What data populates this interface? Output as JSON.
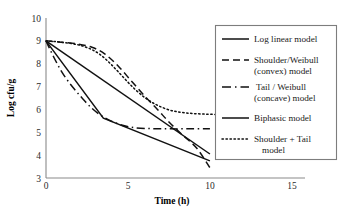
{
  "chart_data": {
    "type": "line",
    "title": "",
    "xlabel": "Time (h)",
    "ylabel": "Log cfu/g",
    "xlim": [
      0,
      15.8
    ],
    "ylim": [
      3,
      10
    ],
    "xticks": [
      "0",
      "5",
      "10",
      "15"
    ],
    "xtick_values": [
      0,
      5,
      10,
      15
    ],
    "yticks": [
      "3",
      "4",
      "5",
      "6",
      "7",
      "8",
      "9",
      "10"
    ],
    "ytick_values": [
      3,
      4,
      5,
      6,
      7,
      8,
      9,
      10
    ],
    "grid": false,
    "legend_position": "upper right",
    "series": [
      {
        "name": "Log linear  model",
        "style": "solid",
        "x": [
          0,
          10
        ],
        "y": [
          9.0,
          4.05
        ]
      },
      {
        "name": "Shoulder/Weibull (convex) model",
        "style": "dashed",
        "x": [
          0,
          0.8,
          1.8,
          2.8,
          3.6,
          4.4,
          5.2,
          6.0,
          6.8,
          7.5,
          8.3,
          9.2,
          10.0
        ],
        "y": [
          9.0,
          8.95,
          8.88,
          8.72,
          8.42,
          7.9,
          7.25,
          6.6,
          6.0,
          5.45,
          4.9,
          4.3,
          3.45
        ]
      },
      {
        "name": "Tail / Weibull (concave) model",
        "style": "dashdot",
        "x": [
          0,
          0.5,
          1.0,
          1.6,
          2.2,
          2.8,
          3.4,
          4.2,
          5.2,
          6.4,
          7.6,
          8.8,
          10.0
        ],
        "y": [
          9.0,
          8.25,
          7.6,
          7.0,
          6.5,
          6.05,
          5.72,
          5.42,
          5.22,
          5.16,
          5.15,
          5.15,
          5.15
        ]
      },
      {
        "name": "Biphasic model",
        "style": "solid",
        "x": [
          0,
          3.5,
          10.0
        ],
        "y": [
          9.0,
          5.62,
          3.75
        ]
      },
      {
        "name": "Shoulder + Tail model",
        "style": "dotted",
        "x": [
          0,
          0.8,
          1.8,
          2.6,
          3.3,
          4.0,
          4.7,
          5.4,
          6.1,
          6.8,
          7.6,
          8.5,
          9.5,
          10.6,
          11.6
        ],
        "y": [
          9.0,
          8.95,
          8.85,
          8.68,
          8.4,
          7.95,
          7.42,
          6.9,
          6.48,
          6.18,
          5.96,
          5.85,
          5.8,
          5.78,
          5.78
        ]
      }
    ]
  },
  "legend": {
    "entries": [
      {
        "label_line1": "Log linear  model",
        "label_line2": ""
      },
      {
        "label_line1": "Shoulder/Weibull",
        "label_line2": "(convex) model"
      },
      {
        "label_line1": "Tail / Weibull",
        "label_line2": "(concave) model"
      },
      {
        "label_line1": "Biphasic model",
        "label_line2": ""
      },
      {
        "label_line1": "Shoulder + Tail",
        "label_line2": "model"
      }
    ]
  }
}
